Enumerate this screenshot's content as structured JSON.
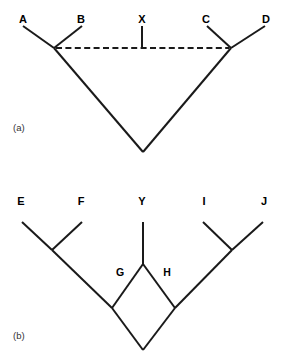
{
  "figure": {
    "type": "cladogram-pair",
    "background_color": "#ffffff",
    "line_color": "#1a1a1a",
    "panels": [
      {
        "id": "a",
        "caption": "(a)",
        "tip_labels": [
          "A",
          "B",
          "X",
          "C",
          "D"
        ],
        "internal_labels": [],
        "solid_branches": [
          {
            "from": "A-tip",
            "to": "node-AB",
            "x1": 23,
            "y1": 26,
            "x2": 54,
            "y2": 48
          },
          {
            "from": "B-tip",
            "to": "node-AB",
            "x1": 82,
            "y1": 26,
            "x2": 54,
            "y2": 48
          },
          {
            "from": "node-AB",
            "to": "root",
            "x1": 54,
            "y1": 48,
            "x2": 143,
            "y2": 152
          },
          {
            "from": "C-tip",
            "to": "node-CD",
            "x1": 207,
            "y1": 26,
            "x2": 231,
            "y2": 48
          },
          {
            "from": "D-tip",
            "to": "node-CD",
            "x1": 265,
            "y1": 26,
            "x2": 231,
            "y2": 48
          },
          {
            "from": "node-CD",
            "to": "root",
            "x1": 231,
            "y1": 48,
            "x2": 143,
            "y2": 152
          }
        ],
        "dashed_branches": [
          {
            "from": "node-AB",
            "to": "node-CD",
            "x1": 56,
            "y1": 48,
            "x2": 229,
            "y2": 48,
            "dash": "6 3"
          },
          {
            "from": "X-tip",
            "to": "dashed-line",
            "x1": 142,
            "y1": 26,
            "x2": 142,
            "y2": 48,
            "dash": "none"
          }
        ],
        "description": "Four-taxon cladogram A,B,C,D with taxon X attached by a dashed horizontal branch linking node-AB and node-CD"
      },
      {
        "id": "b",
        "caption": "(b)",
        "tip_labels": [
          "E",
          "F",
          "Y",
          "I",
          "J"
        ],
        "internal_labels": [
          "G",
          "H"
        ],
        "solid_branches": [
          {
            "from": "E-tip",
            "to": "node-EF",
            "x1": 22,
            "y1": 222,
            "x2": 52,
            "y2": 250
          },
          {
            "from": "F-tip",
            "to": "node-EF",
            "x1": 82,
            "y1": 222,
            "x2": 52,
            "y2": 250
          },
          {
            "from": "node-EF",
            "to": "node-left",
            "x1": 52,
            "y1": 250,
            "x2": 112,
            "y2": 308
          },
          {
            "from": "Y-tip",
            "to": "node-Y",
            "x1": 143,
            "y1": 222,
            "x2": 143,
            "y2": 264
          },
          {
            "from": "node-Y",
            "to": "node-G",
            "x1": 143,
            "y1": 264,
            "x2": 112,
            "y2": 308
          },
          {
            "from": "node-Y",
            "to": "node-H",
            "x1": 143,
            "y1": 264,
            "x2": 175,
            "y2": 308
          },
          {
            "from": "I-tip",
            "to": "node-IJ",
            "x1": 203,
            "y1": 222,
            "x2": 232,
            "y2": 250
          },
          {
            "from": "J-tip",
            "to": "node-IJ",
            "x1": 263,
            "y1": 222,
            "x2": 232,
            "y2": 250
          },
          {
            "from": "node-IJ",
            "to": "node-right",
            "x1": 232,
            "y1": 250,
            "x2": 175,
            "y2": 308
          },
          {
            "from": "node-left",
            "to": "root",
            "x1": 112,
            "y1": 308,
            "x2": 143,
            "y2": 350
          },
          {
            "from": "node-right",
            "to": "root",
            "x1": 175,
            "y1": 308,
            "x2": 143,
            "y2": 350
          }
        ],
        "dashed_branches": [],
        "description": "Five-taxon reticulate cladogram E,F,Y,I,J where Y forms a diamond via branches G and H joining the E-F clade and the I-J clade"
      }
    ]
  },
  "panel_a": {
    "caption": "(a)",
    "labels": {
      "tip1": "A",
      "tip2": "B",
      "tip3": "X",
      "tip4": "C",
      "tip5": "D"
    }
  },
  "panel_b": {
    "caption": "(b)",
    "labels": {
      "tip1": "E",
      "tip2": "F",
      "tip3": "Y",
      "tip4": "I",
      "tip5": "J",
      "nodeG": "G",
      "nodeH": "H"
    }
  }
}
